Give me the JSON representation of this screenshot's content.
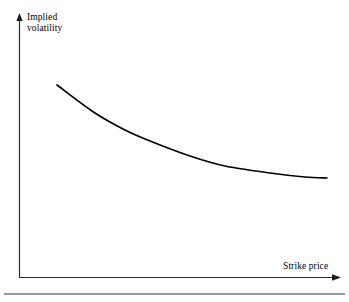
{
  "figure": {
    "background_color": "#ffffff",
    "width": 349,
    "height": 302,
    "top_cropped_caption": "Figure  Implied volatility  equity options",
    "axes": {
      "y_label": "Implied\nvolatility",
      "x_label": "Strike price",
      "axis_color": "#000000",
      "origin": {
        "x": 19,
        "y": 277
      },
      "y_axis_top": 15,
      "x_axis_right": 340
    },
    "rule": {
      "color": "#9a9a9a"
    }
  },
  "chart_data": {
    "type": "line",
    "title": "",
    "xlabel": "Strike price",
    "ylabel": "Implied volatility",
    "xlim": [
      0,
      100
    ],
    "ylim": [
      0,
      100
    ],
    "grid": false,
    "legend": null,
    "axis_ticks": {
      "x": [],
      "y": []
    },
    "series": [
      {
        "name": "Implied volatility skew",
        "color": "#000000",
        "x": [
          12.0,
          24.0,
          35.0,
          41.0,
          54.0,
          65.0,
          78.0,
          88.0,
          96.0
        ],
        "y": [
          100.0,
          85.6,
          74.0,
          69.4,
          59.8,
          53.3,
          47.1,
          44.2,
          43.0
        ],
        "pixel_points": [
          [
            57,
            85
          ],
          [
            95,
            113
          ],
          [
            125,
            130
          ],
          [
            150,
            141
          ],
          [
            190,
            156
          ],
          [
            225,
            166
          ],
          [
            270,
            173
          ],
          [
            305,
            177
          ],
          [
            327,
            178
          ]
        ]
      }
    ],
    "annotations": []
  }
}
